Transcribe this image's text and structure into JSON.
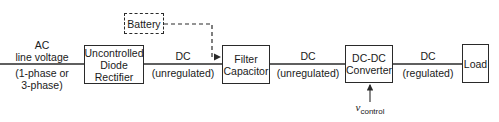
{
  "diagram": {
    "blocks": {
      "rectifier": {
        "line1": "Uncontrolled",
        "line2": "Diode",
        "line3": "Rectifier"
      },
      "battery": {
        "label": "Battery"
      },
      "filter": {
        "line1": "Filter",
        "line2": "Capacitor"
      },
      "converter": {
        "line1": "DC-DC",
        "line2": "Converter"
      },
      "load": {
        "label": "Load"
      }
    },
    "edges": {
      "input": {
        "top1": "AC",
        "top2": "line voltage",
        "bottom1": "(1-phase or",
        "bottom2": "3-phase)"
      },
      "rect_to_filter": {
        "top": "DC",
        "bottom": "(unregulated)"
      },
      "filter_to_conv": {
        "top": "DC",
        "bottom": "(unregulated)"
      },
      "conv_to_load": {
        "top": "DC",
        "bottom": "(regulated)"
      },
      "control": {
        "symbol": "v",
        "subscript": "control"
      }
    },
    "colors": {
      "line": "#2a2a2a",
      "background": "#ffffff"
    }
  }
}
